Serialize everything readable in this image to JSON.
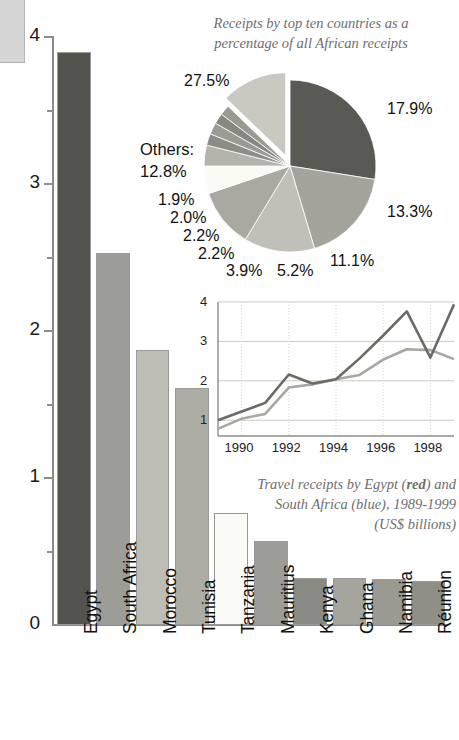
{
  "chart_data": [
    {
      "type": "bar",
      "title": "",
      "xlabel": "",
      "ylabel": "",
      "ylim": [
        0,
        4
      ],
      "yticks": [
        0,
        1,
        2,
        3,
        4
      ],
      "ytick_labels": [
        "0",
        "1",
        "2",
        "3",
        "4"
      ],
      "minor_ticks": [
        0.5,
        1.5,
        2.5,
        3.5
      ],
      "grid": false,
      "categories": [
        "Egypt",
        "South Africa",
        "Morocco",
        "Tunisia",
        "Tanzania",
        "Mauritius",
        "Kenya",
        "Ghana",
        "Namibia",
        "Réunion"
      ],
      "values": [
        3.9,
        2.53,
        1.87,
        1.61,
        0.76,
        0.57,
        0.32,
        0.32,
        0.31,
        0.3
      ],
      "bar_colors": [
        "#54544f",
        "#9d9d97",
        "#bdbdb6",
        "#adada6",
        "#fbfbf6",
        "#9d9d97",
        "#8a8a84",
        "#a5a59e",
        "#9a9a93",
        "#8f8f88"
      ]
    },
    {
      "type": "pie",
      "title": "Receipts by top ten countries as a percentage of all African receipts",
      "title_line1": "Receipts by top ten countries as a",
      "title_line2": "percentage of all African receipts",
      "legend": "none",
      "labels": [
        "27.5%",
        "17.9%",
        "13.3%",
        "11.1%",
        "5.2%",
        "3.9%",
        "2.2%",
        "2.2%",
        "2.0%",
        "1.9%",
        "12.8%"
      ],
      "values": [
        27.5,
        17.9,
        13.3,
        11.1,
        5.2,
        3.9,
        2.2,
        2.2,
        2.0,
        1.9,
        12.8
      ],
      "others_label": "Others:",
      "others_value": "12.8%",
      "slice_colors": [
        "#5a5a55",
        "#a4a49d",
        "#c0c0b9",
        "#a9a9a2",
        "#fbfbf6",
        "#b4b4ad",
        "#8d8d87",
        "#9b9b94",
        "#888882",
        "#9a9a93",
        "#c9c9c2"
      ]
    },
    {
      "type": "line",
      "title": "",
      "caption_line1": "Travel receipts by Egypt (red) and",
      "caption_line2": "South Africa (blue), 1989-1999",
      "caption_line3": "(US$ billions)",
      "caption_red_word": "red",
      "caption_blue_word": "blue",
      "xlabel": "",
      "ylabel": "US$ billions",
      "xlim": [
        1989,
        1999
      ],
      "ylim": [
        0.6,
        4
      ],
      "yticks": [
        1,
        2,
        3,
        4
      ],
      "ytick_labels": [
        "1",
        "2",
        "3",
        "4"
      ],
      "xticks": [
        1990,
        1992,
        1994,
        1996,
        1998
      ],
      "xtick_labels": [
        "1990",
        "1992",
        "1994",
        "1996",
        "1998"
      ],
      "grid": true,
      "x": [
        1989,
        1990,
        1991,
        1992,
        1993,
        1994,
        1995,
        1996,
        1997,
        1998,
        1999
      ],
      "series": [
        {
          "name": "Egypt",
          "color_name": "red",
          "color": "#6b6b66",
          "values": [
            1.0,
            1.22,
            1.44,
            2.16,
            1.93,
            2.04,
            2.57,
            3.15,
            3.76,
            2.59,
            3.94
          ]
        },
        {
          "name": "South Africa",
          "color_name": "blue",
          "color": "#a8a8a2",
          "values": [
            0.78,
            1.04,
            1.16,
            1.83,
            1.91,
            2.04,
            2.15,
            2.54,
            2.8,
            2.78,
            2.55
          ]
        }
      ]
    }
  ],
  "bar_chart": {
    "y_axis": {
      "labels": [
        "4",
        "3",
        "2",
        "1",
        "0"
      ]
    },
    "categories": [
      {
        "label": "Egypt",
        "value": 3.9
      },
      {
        "label": "South Africa",
        "value": 2.53
      },
      {
        "label": "Morocco",
        "value": 1.87
      },
      {
        "label": "Tunisia",
        "value": 1.61
      },
      {
        "label": "Tanzania",
        "value": 0.76
      },
      {
        "label": "Mauritius",
        "value": 0.57
      },
      {
        "label": "Kenya",
        "value": 0.32
      },
      {
        "label": "Ghana",
        "value": 0.32
      },
      {
        "label": "Namibia",
        "value": 0.31
      },
      {
        "label": "Réunion",
        "value": 0.3
      }
    ]
  },
  "pie_chart": {
    "title_line1": "Receipts by top ten countries as a",
    "title_line2": "percentage of all African receipts",
    "others_label": "Others:",
    "others_value": "12.8%",
    "labels": {
      "p275": "27.5%",
      "p179": "17.9%",
      "p133": "13.3%",
      "p111": "11.1%",
      "p52": "5.2%",
      "p39": "3.9%",
      "p22a": "2.2%",
      "p22b": "2.2%",
      "p20": "2.0%",
      "p19": "1.9%"
    }
  },
  "line_chart": {
    "y_labels": [
      "4",
      "3",
      "2",
      "1"
    ],
    "x_labels": [
      "1990",
      "1992",
      "1994",
      "1996",
      "1998"
    ],
    "caption": {
      "pre1": "Travel receipts by Egypt (",
      "red": "red",
      "post1": ") and",
      "pre2": "South Africa (",
      "blue": "blue",
      "post2": "), 1989-1999",
      "line3": "(US$ billions)"
    }
  }
}
